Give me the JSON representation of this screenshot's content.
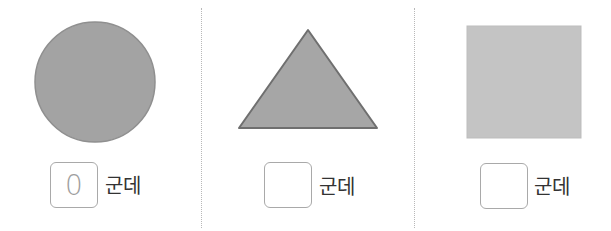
{
  "items": [
    {
      "shape": "circle",
      "answer": "0",
      "unit": "군데"
    },
    {
      "shape": "triangle",
      "answer": "",
      "unit": "군데"
    },
    {
      "shape": "square",
      "answer": "",
      "unit": "군데"
    }
  ],
  "colors": {
    "circle_fill": "#a3a3a3",
    "circle_stroke": "#8f8f8f",
    "triangle_fill": "#a6a6a6",
    "triangle_stroke": "#6f6f6f",
    "square_fill": "#c4c4c4",
    "square_stroke": "#bdbdbd",
    "box_border": "#a9a9a9",
    "divider": "#b8b8b8"
  }
}
